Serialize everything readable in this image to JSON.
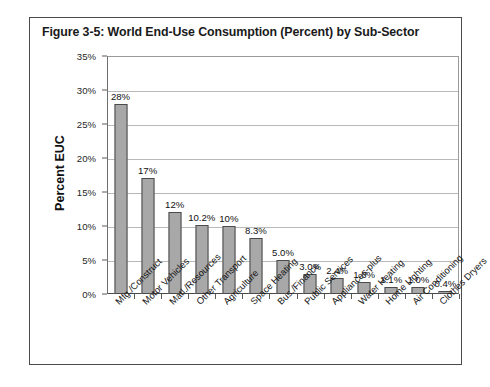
{
  "figure": {
    "title": "Figure 3-5:  World End-Use Consumption (Percent) by Sub-Sector"
  },
  "chart_data": {
    "type": "bar",
    "title": "Figure 3-5:  World End-Use Consumption (Percent) by Sub-Sector",
    "xlabel": "",
    "ylabel": "Percent EUC",
    "ylim": [
      0,
      35
    ],
    "ytick_labels": [
      "0%",
      "5%",
      "10%",
      "15%",
      "20%",
      "25%",
      "30%",
      "35%"
    ],
    "ytick_values": [
      0,
      5,
      10,
      15,
      20,
      25,
      30,
      35
    ],
    "grid": true,
    "legend": false,
    "bar_color": "#a8a8a8",
    "bar_edge_color": "#4b4b4b",
    "categories": [
      "Mfg./Construct",
      "Motor Vehicles",
      "Matl./Resources",
      "Other Transport",
      "Agriculture",
      "Space Heating",
      "Bus./Finance",
      "Public Services",
      "Appliances-plus",
      "Water Heating",
      "Home Lighting",
      "Air Conditioning",
      "Clothes Dryers"
    ],
    "values": [
      28,
      17,
      12,
      10.2,
      10,
      8.3,
      5.0,
      3.0,
      2.4,
      1.8,
      1.1,
      1.0,
      0.4
    ],
    "data_labels": [
      "28%",
      "17%",
      "12%",
      "10.2%",
      "10%",
      "8.3%",
      "5.0%",
      "3.0%",
      "2.4%",
      "1.8%",
      "1.1%",
      "1.0%",
      "0.4%"
    ]
  }
}
